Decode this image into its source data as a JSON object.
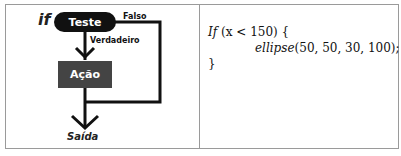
{
  "diagram": {
    "if_label": "if",
    "test_node": "Teste",
    "false_label": "Falso",
    "true_label": "Verdadeiro",
    "action_node": "Ação",
    "exit_label": "Saída"
  },
  "code": {
    "line1_keyword": "If",
    "line1_rest": " (x < 150) {",
    "line2_func": "ellipse",
    "line2_args": "(50, 50, 30, 100);",
    "line3": "}"
  },
  "colors": {
    "pill_bg": "#111111",
    "action_bg": "#444444",
    "border": "#9a9a9a"
  }
}
